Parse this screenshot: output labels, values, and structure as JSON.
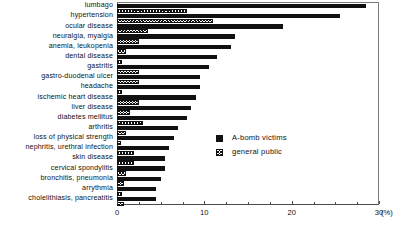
{
  "chart_data": {
    "type": "bar",
    "orientation": "horizontal",
    "title": "",
    "xlabel": "(%)",
    "ylabel": "",
    "xlim": [
      0,
      30
    ],
    "xticks": [
      0,
      10,
      20,
      30
    ],
    "xtick_labels": [
      "0",
      "10",
      "20",
      "30"
    ],
    "unit": "(%)",
    "grid": false,
    "legend_position": "center-right",
    "categories": [
      "lumbago",
      "hypertension",
      "ocular disease",
      "neuralgia, myalgia",
      "anemia, leukopenia",
      "dental disease",
      "gastritis",
      "gastro-duodenal ulcer",
      "headache",
      "ischemic heart disease",
      "liver disease",
      "diabetes mellitus",
      "arthritis",
      "loss of physical strength",
      "nephritis, urethral infection",
      "skin disease",
      "cervical spondylitis",
      "bronchitis, pneumonia",
      "arrythmia",
      "cholelithiasis, pancreatitis"
    ],
    "series": [
      {
        "name": "A-bomb victims",
        "pattern": "solid",
        "values": [
          28.5,
          25.5,
          19.0,
          13.5,
          13.0,
          11.5,
          10.5,
          9.5,
          9.5,
          9.0,
          8.5,
          8.0,
          7.0,
          6.5,
          6.0,
          5.5,
          5.5,
          5.0,
          4.5,
          4.5
        ]
      },
      {
        "name": "general public",
        "pattern": "hatched",
        "values": [
          8.0,
          11.0,
          3.5,
          2.5,
          1.0,
          0.6,
          2.5,
          2.5,
          0.6,
          2.5,
          1.5,
          3.0,
          1.0,
          0.5,
          2.0,
          2.0,
          1.0,
          0.8,
          0.6,
          0.8
        ]
      }
    ]
  },
  "legend": {
    "items": [
      {
        "label": "A-bomb victims",
        "pattern": "solid"
      },
      {
        "label": "general public",
        "pattern": "hatch"
      }
    ]
  },
  "colors": {
    "series_solid": "#111111",
    "series_hatch": "#111111",
    "axis": "#4a4a4a",
    "background": "#ffffff"
  }
}
